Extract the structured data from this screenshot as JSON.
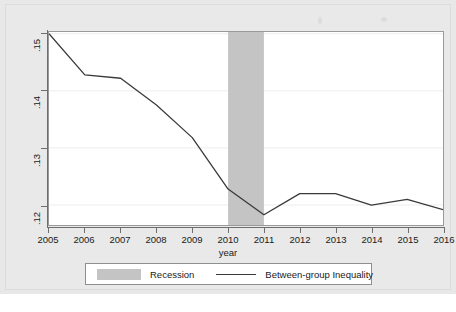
{
  "chart_data": {
    "type": "line",
    "title": "",
    "xlabel": "year",
    "ylabel": "",
    "x": [
      2005,
      2006,
      2007,
      2008,
      2009,
      2010,
      2011,
      2012,
      2013,
      2014,
      2015,
      2016
    ],
    "xtick_labels": [
      "2005",
      "2006",
      "2007",
      "2008",
      "2009",
      "2010",
      "2011",
      "2012",
      "2013",
      "2014",
      "2015",
      "2016"
    ],
    "xlim": [
      2005,
      2016
    ],
    "ytick_labels": [
      ".12",
      ".13",
      ".14",
      ".15"
    ],
    "ytick_values": [
      0.12,
      0.13,
      0.14,
      0.15
    ],
    "ylim": [
      0.1165,
      0.1503
    ],
    "grid": "horizontal",
    "legend_position": "below-axis",
    "series": [
      {
        "name": "Between-group Inequality",
        "type": "line",
        "color": "#3a3a3a",
        "values": [
          0.15,
          0.1428,
          0.1422,
          0.1375,
          0.1318,
          0.1228,
          0.1183,
          0.122,
          0.122,
          0.12,
          0.121,
          0.1192
        ]
      }
    ],
    "shaded_regions": [
      {
        "name": "Recession",
        "x_start": 2010,
        "x_end": 2011,
        "color": "#c4c4c4"
      }
    ]
  },
  "axes": {
    "x_title": "year",
    "y_ticks": [
      {
        "label": ".15",
        "value": 0.15
      },
      {
        "label": ".14",
        "value": 0.14
      },
      {
        "label": ".13",
        "value": 0.13
      },
      {
        "label": ".12",
        "value": 0.12
      }
    ],
    "x_ticks": [
      {
        "label": "2005",
        "value": 2005
      },
      {
        "label": "2006",
        "value": 2006
      },
      {
        "label": "2007",
        "value": 2007
      },
      {
        "label": "2008",
        "value": 2008
      },
      {
        "label": "2009",
        "value": 2009
      },
      {
        "label": "2010",
        "value": 2010
      },
      {
        "label": "2011",
        "value": 2011
      },
      {
        "label": "2012",
        "value": 2012
      },
      {
        "label": "2013",
        "value": 2013
      },
      {
        "label": "2014",
        "value": 2014
      },
      {
        "label": "2015",
        "value": 2015
      },
      {
        "label": "2016",
        "value": 2016
      }
    ]
  },
  "legend": {
    "items": [
      {
        "key": "recession",
        "label": "Recession",
        "marker": "filled-square-swatch",
        "color": "#c4c4c4"
      },
      {
        "key": "inequality",
        "label": "Between-group Inequality",
        "marker": "line-segment",
        "color": "#3a3a3a"
      }
    ]
  },
  "colors": {
    "plot_background": "#ffffff",
    "figure_background": "#e8e8e8",
    "axis": "#6e6e6e",
    "gridline": "#ededed",
    "series_line": "#3a3a3a",
    "recession_band": "#c4c4c4",
    "text": "#1a1a1a"
  }
}
